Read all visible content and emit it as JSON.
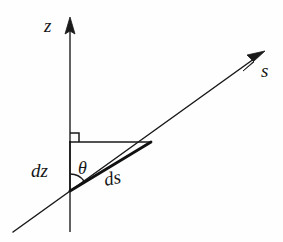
{
  "figure": {
    "kind": "geometric-diagram",
    "background_color": "#fefefe",
    "stroke_color": "#1a1a1a"
  },
  "axes": [
    {
      "id": "z-axis",
      "label": "z",
      "orientation": "vertical",
      "arrow": "up",
      "start": [
        70,
        232
      ],
      "end": [
        70,
        18
      ],
      "label_position": [
        44,
        16
      ]
    },
    {
      "id": "s-axis",
      "label": "s",
      "orientation": "inclined",
      "arrow": "up-right",
      "start": [
        13,
        232
      ],
      "end": [
        265,
        51
      ],
      "label_position": [
        261,
        61
      ]
    }
  ],
  "triangle": {
    "vertices": {
      "corner_right_angle": [
        70,
        142
      ],
      "corner_upper_right": [
        150,
        142
      ],
      "corner_theta": [
        70,
        191
      ]
    },
    "sides": [
      {
        "id": "vertical-leg",
        "label": "dz",
        "from": [
          70,
          142
        ],
        "to": [
          70,
          191
        ],
        "weight": 1.4
      },
      {
        "id": "horizontal-leg",
        "label": "",
        "from": [
          70,
          142
        ],
        "to": [
          150,
          142
        ],
        "weight": 1.4
      },
      {
        "id": "hypotenuse",
        "label": "ds",
        "from": [
          70,
          191
        ],
        "to": [
          150,
          142
        ],
        "weight": 2.6
      }
    ]
  },
  "markers": {
    "right_angle": {
      "name": "right-angle-marker",
      "at": [
        70,
        142
      ],
      "size": 9
    },
    "angle_arc": {
      "name": "theta-angle-arc",
      "at": [
        70,
        191
      ],
      "radius": 17,
      "label": "θ"
    }
  },
  "labels": {
    "z": "z",
    "s": "s",
    "dz": "dz",
    "theta": "θ",
    "ds": "ds"
  }
}
